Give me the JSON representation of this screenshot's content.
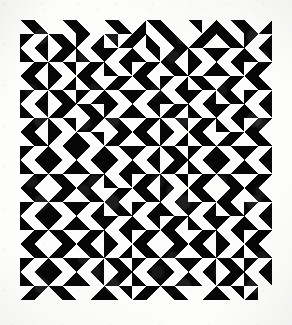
{
  "artwork": {
    "title": "Truchet triangle tiling",
    "medium_note": "black ink print on off-white paper",
    "colors": {
      "ink": "#0d0d0d",
      "paper": "#fdfdfc",
      "page_background": "#ffffff",
      "vignette": "rgba(0,0,0,0.075)"
    },
    "canvas": {
      "width": 292,
      "height": 325
    },
    "grid": {
      "origin_x": 20,
      "origin_y": 20,
      "tile_size": 14,
      "columns": 18,
      "rows": 20,
      "width": 252,
      "height": 280,
      "orientation_legend": {
        "0": "black right-triangle filling the top-left half (hypotenuse runs from bottom-left to top-right)",
        "1": "black right-triangle filling the top-right half (hypotenuse runs from top-left to bottom-right)",
        "2": "black right-triangle filling the bottom-right half (hypotenuse runs from bottom-left to top-right)",
        "3": "black right-triangle filling the bottom-left half (hypotenuse runs from top-left to bottom-right)",
        "4": "empty tile, paper showing through"
      }
    },
    "tiles": [
      [
        1,
        3,
        4,
        1,
        3,
        4,
        1,
        3,
        2,
        1,
        3,
        4,
        1,
        2,
        3,
        1,
        3,
        2
      ],
      [
        0,
        2,
        1,
        3,
        0,
        2,
        1,
        2,
        0,
        3,
        1,
        3,
        2,
        0,
        1,
        3,
        0,
        2
      ],
      [
        3,
        1,
        2,
        0,
        3,
        1,
        0,
        2,
        3,
        1,
        2,
        0,
        3,
        1,
        0,
        2,
        3,
        1
      ],
      [
        2,
        0,
        3,
        1,
        2,
        0,
        3,
        1,
        2,
        0,
        1,
        3,
        0,
        2,
        3,
        1,
        2,
        0
      ],
      [
        1,
        3,
        0,
        2,
        1,
        3,
        2,
        0,
        1,
        3,
        0,
        2,
        1,
        3,
        2,
        0,
        1,
        3
      ],
      [
        0,
        2,
        1,
        3,
        0,
        2,
        3,
        1,
        0,
        2,
        3,
        1,
        0,
        2,
        1,
        3,
        0,
        2
      ],
      [
        3,
        1,
        2,
        0,
        1,
        3,
        0,
        2,
        3,
        1,
        2,
        0,
        3,
        1,
        0,
        2,
        3,
        1
      ],
      [
        2,
        0,
        3,
        1,
        2,
        0,
        1,
        3,
        2,
        0,
        3,
        1,
        2,
        0,
        3,
        1,
        2,
        0
      ],
      [
        1,
        3,
        0,
        2,
        3,
        1,
        2,
        0,
        1,
        3,
        0,
        2,
        1,
        3,
        2,
        0,
        1,
        3
      ],
      [
        0,
        2,
        3,
        1,
        0,
        2,
        3,
        1,
        0,
        2,
        1,
        3,
        0,
        2,
        3,
        1,
        0,
        2
      ],
      [
        3,
        1,
        0,
        2,
        3,
        1,
        0,
        2,
        3,
        1,
        2,
        0,
        3,
        1,
        0,
        2,
        3,
        1
      ],
      [
        2,
        0,
        1,
        3,
        2,
        0,
        3,
        1,
        2,
        0,
        3,
        1,
        2,
        0,
        1,
        3,
        2,
        0
      ],
      [
        1,
        3,
        2,
        0,
        1,
        3,
        2,
        0,
        1,
        3,
        0,
        2,
        1,
        3,
        2,
        0,
        1,
        3
      ],
      [
        0,
        2,
        3,
        1,
        0,
        2,
        1,
        3,
        0,
        2,
        3,
        1,
        0,
        2,
        1,
        3,
        0,
        2
      ],
      [
        3,
        1,
        0,
        2,
        3,
        1,
        0,
        2,
        3,
        1,
        2,
        0,
        3,
        1,
        0,
        2,
        3,
        1
      ],
      [
        2,
        0,
        1,
        3,
        2,
        0,
        3,
        1,
        2,
        0,
        1,
        3,
        2,
        0,
        3,
        1,
        2,
        0
      ],
      [
        1,
        3,
        2,
        0,
        1,
        3,
        0,
        2,
        1,
        3,
        2,
        0,
        1,
        3,
        0,
        2,
        1,
        3
      ],
      [
        0,
        2,
        3,
        1,
        0,
        2,
        1,
        3,
        0,
        2,
        3,
        1,
        0,
        2,
        1,
        3,
        0,
        2
      ],
      [
        3,
        1,
        0,
        2,
        3,
        1,
        2,
        0,
        3,
        1,
        0,
        2,
        3,
        1,
        2,
        0,
        3,
        1
      ],
      [
        2,
        0,
        1,
        3,
        4,
        2,
        3,
        1,
        2,
        0,
        1,
        3,
        4,
        2,
        3,
        1,
        2,
        4
      ]
    ]
  }
}
